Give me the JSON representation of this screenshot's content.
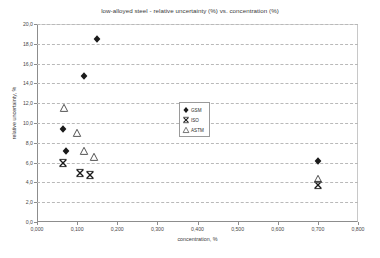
{
  "chart_data": {
    "type": "scatter",
    "title": "low-alloyed steel - relative uncertainty (%) vs. concentration (%)",
    "xlabel": "concentration, %",
    "ylabel": "relative uncertainty, %",
    "xlim": [
      0.0,
      0.8
    ],
    "ylim": [
      0.0,
      20.0
    ],
    "xticks": [
      0.0,
      0.1,
      0.2,
      0.3,
      0.4,
      0.5,
      0.6,
      0.7,
      0.8
    ],
    "xtick_labels": [
      "0,000",
      "0,100",
      "0,200",
      "0,300",
      "0,400",
      "0,500",
      "0,600",
      "0,700",
      "0,800"
    ],
    "yticks": [
      0.0,
      2.0,
      4.0,
      6.0,
      8.0,
      10.0,
      12.0,
      14.0,
      16.0,
      18.0,
      20.0
    ],
    "ytick_labels": [
      "0,0",
      "2,0",
      "4,0",
      "6,0",
      "8,0",
      "10,0",
      "12,0",
      "14,0",
      "16,0",
      "18,0",
      "20,0"
    ],
    "grid": "horizontal-dashed",
    "legend_position": "center",
    "series": [
      {
        "name": "GSM",
        "marker": "diamond",
        "color": "#1a1a1a",
        "points": [
          {
            "x": 0.15,
            "y": 18.5
          },
          {
            "x": 0.116,
            "y": 14.7
          },
          {
            "x": 0.066,
            "y": 9.4
          },
          {
            "x": 0.072,
            "y": 7.2
          },
          {
            "x": 0.7,
            "y": 6.2
          }
        ]
      },
      {
        "name": "ISO",
        "marker": "cross-x",
        "color": "#1a1a1a",
        "points": [
          {
            "x": 0.066,
            "y": 6.0
          },
          {
            "x": 0.107,
            "y": 5.0
          },
          {
            "x": 0.131,
            "y": 4.7
          },
          {
            "x": 0.7,
            "y": 3.7
          }
        ]
      },
      {
        "name": "ASTM",
        "marker": "triangle",
        "color": "#555555",
        "points": [
          {
            "x": 0.068,
            "y": 11.5
          },
          {
            "x": 0.1,
            "y": 9.0
          },
          {
            "x": 0.116,
            "y": 7.2
          },
          {
            "x": 0.141,
            "y": 6.6
          },
          {
            "x": 0.7,
            "y": 4.3
          }
        ]
      }
    ]
  },
  "legend": {
    "entries": [
      {
        "label": "GSM",
        "marker": "diamond"
      },
      {
        "label": "ISO",
        "marker": "cross-x"
      },
      {
        "label": "ASTM",
        "marker": "triangle"
      }
    ]
  },
  "footer": {
    "note": ""
  }
}
